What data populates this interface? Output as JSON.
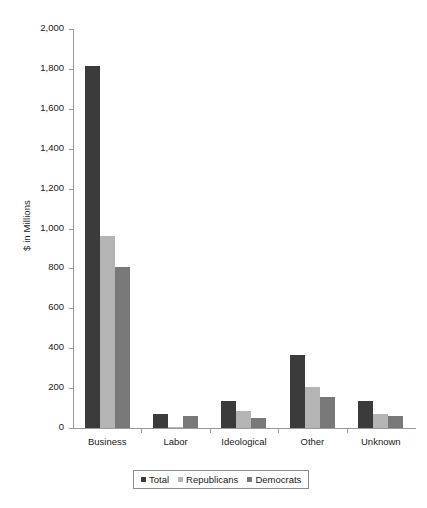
{
  "chart_data": {
    "type": "bar",
    "title": "",
    "xlabel": "",
    "ylabel": "$ in Millions",
    "ylim": [
      0,
      2000
    ],
    "ytick_step": 200,
    "ytick_labels": [
      "2,000",
      "1,800",
      "1,600",
      "1,400",
      "1,200",
      "1,000",
      "800",
      "600",
      "400",
      "200",
      "0"
    ],
    "ytick_values": [
      2000,
      1800,
      1600,
      1400,
      1200,
      1000,
      800,
      600,
      400,
      200,
      0
    ],
    "grid": false,
    "legend_position": "bottom",
    "categories": [
      "Business",
      "Labor",
      "Ideological",
      "Other",
      "Unknown"
    ],
    "series": [
      {
        "name": "Total",
        "color": "#3b3b3b",
        "values": [
          1815,
          68,
          135,
          365,
          135
        ]
      },
      {
        "name": "Republicans",
        "color": "#b4b4b4",
        "values": [
          962,
          5,
          85,
          205,
          70
        ]
      },
      {
        "name": "Democrats",
        "color": "#787878",
        "values": [
          807,
          58,
          48,
          155,
          58
        ]
      }
    ]
  },
  "legend": {
    "items": [
      {
        "label": "Total",
        "color": "#3b3b3b"
      },
      {
        "label": "Republicans",
        "color": "#b4b4b4"
      },
      {
        "label": "Democrats",
        "color": "#787878"
      }
    ]
  },
  "axis": {
    "y_title": "$ in Millions"
  },
  "colors": {
    "axis_line": "#9b9b9b",
    "text": "#1a1a1a",
    "background": "#ffffff",
    "legend_border": "#8c8c8c"
  }
}
